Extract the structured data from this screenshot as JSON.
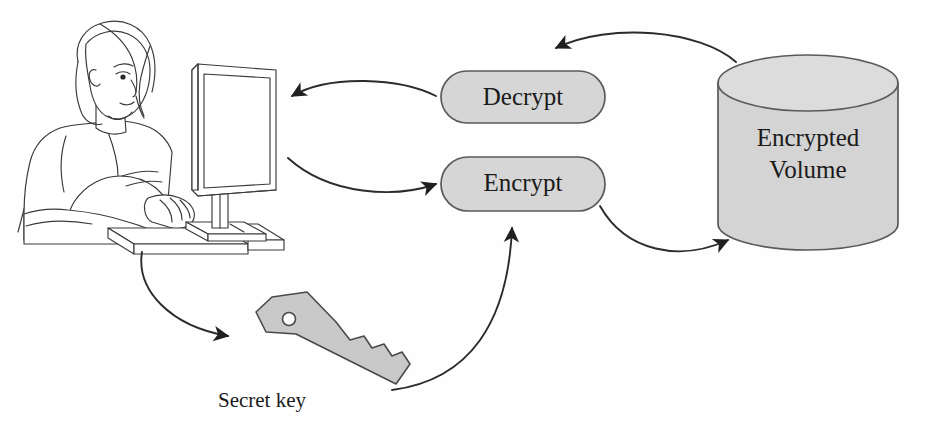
{
  "diagram": {
    "background_color": "#fefefe",
    "nodes": {
      "operator": {
        "name": "person-at-computer",
        "label": "",
        "description": "Woman seated at a desk typing on a keyboard in front of a monitor"
      },
      "decrypt": {
        "label": "Decrypt",
        "shape": "rounded-pill",
        "fill_color": "#d6d6d6",
        "stroke_color": "#5a5a5a"
      },
      "encrypt": {
        "label": "Encrypt",
        "shape": "rounded-pill",
        "fill_color": "#d6d6d6",
        "stroke_color": "#5a5a5a"
      },
      "volume": {
        "label_line1": "Encrypted",
        "label_line2": "Volume",
        "shape": "cylinder",
        "fill_color": "#d4d4d4",
        "top_fill_color": "#dcdcdc",
        "stroke_color": "#5a5a5a"
      },
      "key": {
        "label": "Secret key",
        "shape": "key",
        "fill_color": "#c9c9c9",
        "stroke_color": "#4a4a4a"
      }
    },
    "arrows": [
      {
        "name": "decrypt-to-operator",
        "from": "decrypt",
        "to": "operator",
        "direction": "left"
      },
      {
        "name": "operator-to-encrypt",
        "from": "operator",
        "to": "encrypt",
        "direction": "right"
      },
      {
        "name": "volume-to-decrypt",
        "from": "volume",
        "to": "decrypt",
        "direction": "left"
      },
      {
        "name": "encrypt-to-volume",
        "from": "encrypt",
        "to": "volume",
        "direction": "right"
      },
      {
        "name": "operator-to-key",
        "from": "operator",
        "to": "key",
        "direction": "down-right"
      },
      {
        "name": "key-to-encrypt",
        "from": "key",
        "to": "encrypt",
        "direction": "up"
      }
    ]
  }
}
